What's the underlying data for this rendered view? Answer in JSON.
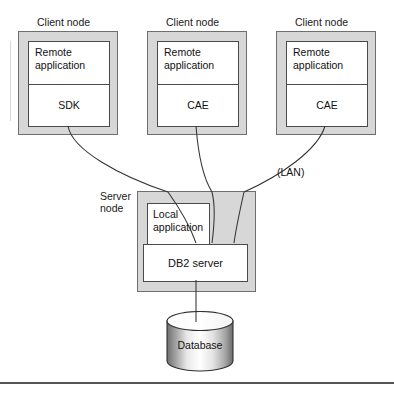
{
  "diagram": {
    "colors": {
      "node_fill": "#d7d7d7",
      "node_border": "#6e6e6e",
      "inner_fill": "#ffffff",
      "inner_border": "#4a4a4a",
      "text": "#111111",
      "connector": "#333333",
      "rule": "#555555"
    },
    "client_nodes": [
      {
        "caption": "Client node",
        "top_cell": "Remote\napplication",
        "top_cell_line1": "Remote",
        "top_cell_line2": "application",
        "bottom_cell": "SDK"
      },
      {
        "caption": "Client node",
        "top_cell": "Remote\napplication",
        "top_cell_line1": "Remote",
        "top_cell_line2": "application",
        "bottom_cell": "CAE"
      },
      {
        "caption": "Client node",
        "top_cell": "Remote\napplication",
        "top_cell_line1": "Remote",
        "top_cell_line2": "application",
        "bottom_cell": "CAE"
      }
    ],
    "server_node": {
      "caption_line1": "Server",
      "caption_line2": "node",
      "local_app_line1": "Local",
      "local_app_line2": "application",
      "db2_label": "DB2 server"
    },
    "network_label": "(LAN)",
    "database": {
      "label": "Database"
    }
  }
}
